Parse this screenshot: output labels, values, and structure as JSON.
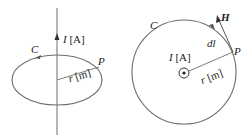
{
  "figures": [
    {
      "id": "left",
      "labels": {
        "current": "I [A]",
        "current_var": "I",
        "current_unit": "[A]",
        "contour": "C",
        "point": "P",
        "radius": "r [m]",
        "radius_var": "r",
        "radius_unit": "[m]"
      }
    },
    {
      "id": "right",
      "labels": {
        "current": "I [A]",
        "current_var": "I",
        "current_unit": "[A]",
        "contour": "C",
        "point": "P",
        "radius": "r [m]",
        "radius_var": "r",
        "radius_unit": "[m]",
        "element": "dl",
        "field": "H"
      }
    }
  ],
  "colors": {
    "stroke": "#6e6e6e",
    "text": "#222222"
  }
}
